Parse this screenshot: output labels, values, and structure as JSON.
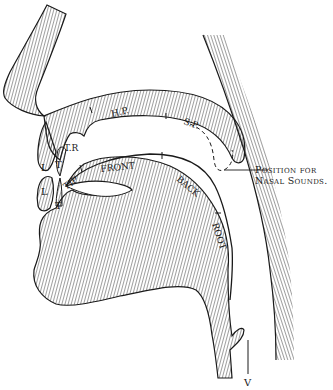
{
  "figure": {
    "type": "sagittal-section-vocal-tract",
    "colors": {
      "ink": "#1a1a1a",
      "hatch": "#2a2a2a",
      "paper": "#ffffff"
    }
  },
  "labels": {
    "upper_lip": "L",
    "lower_lip": "L",
    "upper_teeth": "T",
    "lower_teeth": "T",
    "teeth_ridge": "T.R",
    "hard_palate": "H.P.",
    "soft_palate": "S.P.",
    "tongue_tip": "TIP",
    "tongue_front": "FRONT",
    "tongue_back": "BACK",
    "tongue_root": "ROOT",
    "vocal_cords": "V",
    "nasal_line1": "Position for",
    "nasal_line2": "Nasal Sounds."
  }
}
